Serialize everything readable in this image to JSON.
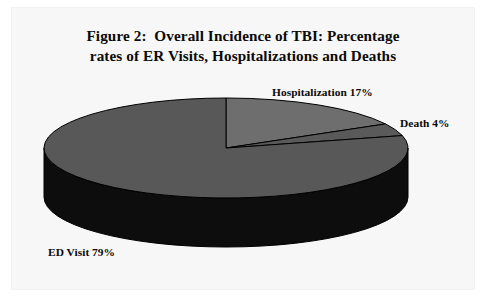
{
  "figure": {
    "title_line1": "Figure 2:  Overall Incidence of TBI: Percentage",
    "title_line2": "rates of ER Visits, Hospitalizations and Deaths",
    "background_color": "#ffffff",
    "panel_color": "#f7f7f7",
    "text_color": "#0a0a0a"
  },
  "labels": {
    "hospitalization": "Hospitalization 17%",
    "death": "Death 4%",
    "ed_visit": "ED Visit 79%"
  },
  "chart_data": {
    "type": "pie",
    "title": "Figure 2:  Overall Incidence of TBI: Percentage rates of ER Visits, Hospitalizations and Deaths",
    "xlabel": "",
    "ylabel": "",
    "categories": [
      "Hospitalization",
      "Death",
      "ED Visit"
    ],
    "values": [
      17,
      4,
      79
    ],
    "unit": "percent",
    "total": 100,
    "data_labels": [
      "Hospitalization 17%",
      "Death 4%",
      "ED Visit 79%"
    ],
    "colors": [
      "#6e6e6e",
      "#5a5a5a",
      "#585858"
    ],
    "side_colors": [
      "#141414",
      "#111111",
      "#0d0d0d"
    ],
    "legend": "none",
    "grid": false,
    "style": "3d-pie",
    "start_angle_deg": 0,
    "direction": "clockwise",
    "annotations": [
      {
        "text": "Hospitalization 17%",
        "position": "top-right",
        "series": "Hospitalization"
      },
      {
        "text": "Death 4%",
        "position": "right",
        "series": "Death"
      },
      {
        "text": "ED Visit 79%",
        "position": "bottom-left",
        "series": "ED Visit"
      }
    ]
  },
  "geometry": {
    "center_x": 226,
    "center_y": 148,
    "radius_x": 182,
    "radius_y": 50,
    "depth": 49,
    "outline_color": "#000000"
  }
}
